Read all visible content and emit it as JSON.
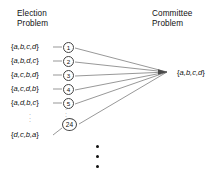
{
  "figure": {
    "width": 213,
    "height": 177,
    "background": "#ffffff",
    "ink": "#111111",
    "line_color": "#6b6b6b"
  },
  "headers": {
    "left": {
      "line1": "Election",
      "line2": "Problem"
    },
    "right": {
      "line1": "Committee",
      "line2": "Problem"
    }
  },
  "election_problem": {
    "permutations": [
      {
        "open": "{",
        "letters": "a,b,c,d",
        "close": "}"
      },
      {
        "open": "{",
        "letters": "a,b,d,c",
        "close": "}"
      },
      {
        "open": "{",
        "letters": "a,c,b,d",
        "close": "}"
      },
      {
        "open": "{",
        "letters": "a,c,d,b",
        "close": "}"
      },
      {
        "open": "{",
        "letters": "a,d,b,c",
        "close": "}"
      },
      {
        "open": "{",
        "letters": "d,c,b,a",
        "close": "}"
      }
    ],
    "node_numbers": [
      "1",
      "2",
      "3",
      "4",
      "5",
      "24"
    ],
    "ellipsis_symbol": "·"
  },
  "committee_problem": {
    "target": {
      "open": "{",
      "letters": "a,b,c,d",
      "close": "}"
    }
  },
  "bottom_ellipsis": {
    "count": 3
  }
}
